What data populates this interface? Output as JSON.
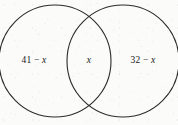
{
  "figure": {
    "name": "two-set-venn-diagram",
    "background_color": "#fbfbfa",
    "stroke_color": "#2b2b2b",
    "text_color": "#171717"
  },
  "labels": {
    "left_only": "41 − x",
    "intersection": "x",
    "right_only": "32 − x"
  },
  "chart_data": {
    "type": "venn",
    "sets": [
      {
        "name": "left-circle",
        "region_label": "41 − x",
        "cx": 55,
        "cy": 61,
        "r": 56
      },
      {
        "name": "right-circle",
        "region_label": "32 − x",
        "cx": 123,
        "cy": 61,
        "r": 56
      }
    ],
    "intersection_label": "x",
    "title": "",
    "grid": false,
    "legend": "none"
  }
}
